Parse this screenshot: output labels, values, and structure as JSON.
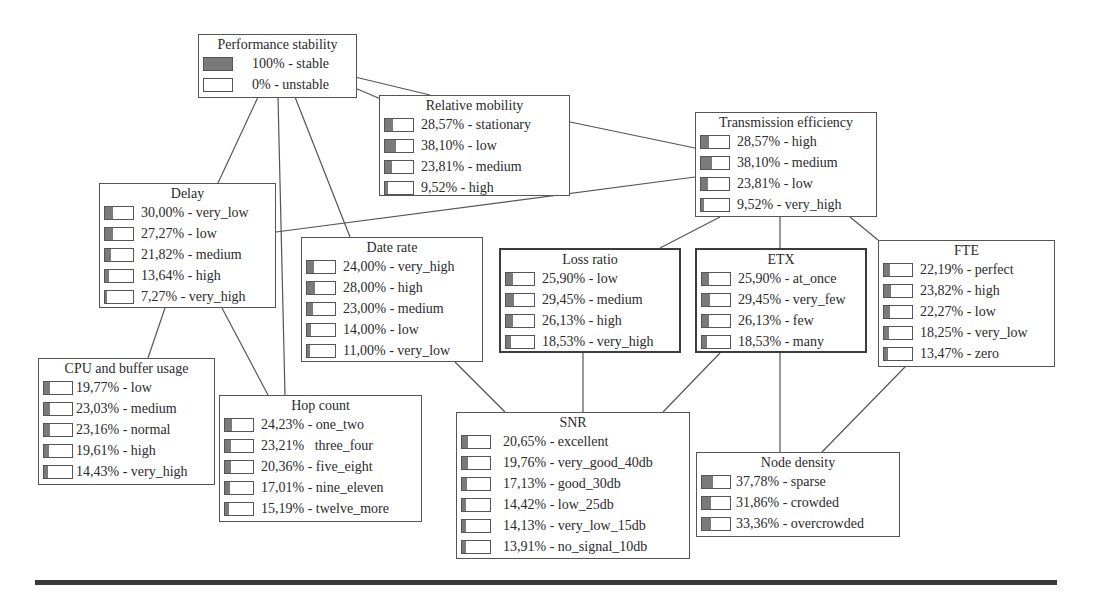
{
  "diagram": {
    "type": "bayesian-network",
    "colors": {
      "border": "#555555",
      "bar_fill": "#7a7a7a",
      "edge": "#555555",
      "footer_rule": "#3a3a3a"
    },
    "nodes": {
      "performance_stability": {
        "title": "Performance stability",
        "states": [
          {
            "pct": "100%",
            "label": "stable",
            "text": "100% - stable",
            "fill": 100
          },
          {
            "pct": "0%",
            "label": "unstable",
            "text": "0% - unstable",
            "fill": 0
          }
        ]
      },
      "relative_mobility": {
        "title": "Relative mobility",
        "states": [
          {
            "pct": "28,57%",
            "label": "stationary",
            "text": "28,57% - stationary",
            "fill": 28.57
          },
          {
            "pct": "38,10%",
            "label": "low",
            "text": "38,10% - low",
            "fill": 38.1
          },
          {
            "pct": "23,81%",
            "label": "medium",
            "text": "23,81% - medium",
            "fill": 23.81
          },
          {
            "pct": "9,52%",
            "label": "high",
            "text": "9,52% - high",
            "fill": 9.52
          }
        ]
      },
      "transmission_efficiency": {
        "title": "Transmission efficiency",
        "states": [
          {
            "pct": "28,57%",
            "label": "high",
            "text": "28,57% - high",
            "fill": 28.57
          },
          {
            "pct": "38,10%",
            "label": "medium",
            "text": "38,10% - medium",
            "fill": 38.1
          },
          {
            "pct": "23,81%",
            "label": "low",
            "text": "23,81% - low",
            "fill": 23.81
          },
          {
            "pct": "9,52%",
            "label": "very_high",
            "text": "9,52% - very_high",
            "fill": 9.52
          }
        ]
      },
      "delay": {
        "title": "Delay",
        "states": [
          {
            "pct": "30,00%",
            "label": "very_low",
            "text": "30,00% - very_low",
            "fill": 30.0
          },
          {
            "pct": "27,27%",
            "label": "low",
            "text": "27,27% - low",
            "fill": 27.27
          },
          {
            "pct": "21,82%",
            "label": "medium",
            "text": "21,82% - medium",
            "fill": 21.82
          },
          {
            "pct": "13,64%",
            "label": "high",
            "text": "13,64% - high",
            "fill": 13.64
          },
          {
            "pct": "7,27%",
            "label": "very_high",
            "text": "7,27% - very_high",
            "fill": 7.27
          }
        ]
      },
      "date_rate": {
        "title": "Date rate",
        "states": [
          {
            "pct": "24,00%",
            "label": "very_high",
            "text": "24,00% - very_high",
            "fill": 24.0
          },
          {
            "pct": "28,00%",
            "label": "high",
            "text": "28,00% - high",
            "fill": 28.0
          },
          {
            "pct": "23,00%",
            "label": "medium",
            "text": "23,00% - medium",
            "fill": 23.0
          },
          {
            "pct": "14,00%",
            "label": "low",
            "text": "14,00% - low",
            "fill": 14.0
          },
          {
            "pct": "11,00%",
            "label": "very_low",
            "text": "11,00% - very_low",
            "fill": 11.0
          }
        ]
      },
      "loss_ratio": {
        "title": "Loss ratio",
        "states": [
          {
            "pct": "25,90%",
            "label": "low",
            "text": "25,90% - low",
            "fill": 25.9
          },
          {
            "pct": "29,45%",
            "label": "medium",
            "text": "29,45% - medium",
            "fill": 29.45
          },
          {
            "pct": "26,13%",
            "label": "high",
            "text": "26,13% - high",
            "fill": 26.13
          },
          {
            "pct": "18,53%",
            "label": "very_high",
            "text": "18,53% - very_high",
            "fill": 18.53
          }
        ]
      },
      "etx": {
        "title": "ETX",
        "states": [
          {
            "pct": "25,90%",
            "label": "at_once",
            "text": "25,90% - at_once",
            "fill": 25.9
          },
          {
            "pct": "29,45%",
            "label": "very_few",
            "text": "29,45% - very_few",
            "fill": 29.45
          },
          {
            "pct": "26,13%",
            "label": "few",
            "text": "26,13% - few",
            "fill": 26.13
          },
          {
            "pct": "18,53%",
            "label": "many",
            "text": "18,53% - many",
            "fill": 18.53
          }
        ]
      },
      "fte": {
        "title": "FTE",
        "states": [
          {
            "pct": "22,19%",
            "label": "perfect",
            "text": "22,19% - perfect",
            "fill": 22.19
          },
          {
            "pct": "23,82%",
            "label": "high",
            "text": "23,82% - high",
            "fill": 23.82
          },
          {
            "pct": "22,27%",
            "label": "low",
            "text": "22,27% - low",
            "fill": 22.27
          },
          {
            "pct": "18,25%",
            "label": "very_low",
            "text": "18,25% - very_low",
            "fill": 18.25
          },
          {
            "pct": "13,47%",
            "label": "zero",
            "text": "13,47% - zero",
            "fill": 13.47
          }
        ]
      },
      "cpu_buffer_usage": {
        "title": "CPU and buffer usage",
        "states": [
          {
            "pct": "19,77%",
            "label": "low",
            "text": "19,77% - low",
            "fill": 19.77
          },
          {
            "pct": "23,03%",
            "label": "medium",
            "text": "23,03% - medium",
            "fill": 23.03
          },
          {
            "pct": "23,16%",
            "label": "normal",
            "text": "23,16% - normal",
            "fill": 23.16
          },
          {
            "pct": "19,61%",
            "label": "high",
            "text": "19,61% - high",
            "fill": 19.61
          },
          {
            "pct": "14,43%",
            "label": "very_high",
            "text": "14,43% - very_high",
            "fill": 14.43
          }
        ]
      },
      "hop_count": {
        "title": "Hop count",
        "states": [
          {
            "pct": "24,23%",
            "label": "one_two",
            "text": "24,23% - one_two",
            "fill": 24.23
          },
          {
            "pct": "23,21%",
            "label": "three_four",
            "text": "23,21%   three_four",
            "fill": 23.21
          },
          {
            "pct": "20,36%",
            "label": "five_eight",
            "text": "20,36% - five_eight",
            "fill": 20.36
          },
          {
            "pct": "17,01%",
            "label": "nine_eleven",
            "text": "17,01% - nine_eleven",
            "fill": 17.01
          },
          {
            "pct": "15,19%",
            "label": "twelve_more",
            "text": "15,19% - twelve_more",
            "fill": 15.19
          }
        ]
      },
      "snr": {
        "title": "SNR",
        "states": [
          {
            "pct": "20,65%",
            "label": "excellent",
            "text": "20,65% - excellent",
            "fill": 20.65
          },
          {
            "pct": "19,76%",
            "label": "very_good_40db",
            "text": "19,76% - very_good_40db",
            "fill": 19.76
          },
          {
            "pct": "17,13%",
            "label": "good_30db",
            "text": "17,13% - good_30db",
            "fill": 17.13
          },
          {
            "pct": "14,42%",
            "label": "low_25db",
            "text": "14,42% - low_25db",
            "fill": 14.42
          },
          {
            "pct": "14,13%",
            "label": "very_low_15db",
            "text": "14,13% - very_low_15db",
            "fill": 14.13
          },
          {
            "pct": "13,91%",
            "label": "no_signal_10db",
            "text": "13,91% - no_signal_10db",
            "fill": 13.91
          }
        ]
      },
      "node_density": {
        "title": "Node density",
        "states": [
          {
            "pct": "37,78%",
            "label": "sparse",
            "text": "37,78% - sparse",
            "fill": 37.78
          },
          {
            "pct": "31,86%",
            "label": "crowded",
            "text": "31,86% - crowded",
            "fill": 31.86
          },
          {
            "pct": "33,36%",
            "label": "overcrowded",
            "text": "33,36% - overcrowded",
            "fill": 33.36
          }
        ]
      }
    },
    "edges": [
      {
        "from": "performance_stability",
        "to": "relative_mobility"
      },
      {
        "from": "performance_stability",
        "to": "delay"
      },
      {
        "from": "performance_stability",
        "to": "hop_count"
      },
      {
        "from": "performance_stability",
        "to": "date_rate"
      },
      {
        "from": "relative_mobility",
        "to": "transmission_efficiency"
      },
      {
        "from": "delay",
        "to": "transmission_efficiency"
      },
      {
        "from": "delay",
        "to": "cpu_buffer_usage"
      },
      {
        "from": "delay",
        "to": "hop_count"
      },
      {
        "from": "transmission_efficiency",
        "to": "loss_ratio"
      },
      {
        "from": "transmission_efficiency",
        "to": "etx"
      },
      {
        "from": "transmission_efficiency",
        "to": "fte"
      },
      {
        "from": "date_rate",
        "to": "snr"
      },
      {
        "from": "loss_ratio",
        "to": "snr"
      },
      {
        "from": "etx",
        "to": "snr"
      },
      {
        "from": "etx",
        "to": "node_density"
      },
      {
        "from": "fte",
        "to": "node_density"
      }
    ]
  }
}
